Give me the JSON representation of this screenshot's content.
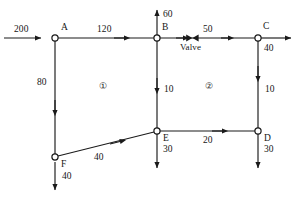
{
  "diagram": {
    "type": "flow-network",
    "stroke_color": "#1a1a1a",
    "text_color": "#161616",
    "background": "#ffffff",
    "nodes": [
      {
        "id": "A",
        "label": "A",
        "x": 55,
        "y": 38
      },
      {
        "id": "B",
        "label": "B",
        "x": 157,
        "y": 38
      },
      {
        "id": "C",
        "label": "C",
        "x": 258,
        "y": 38
      },
      {
        "id": "D",
        "label": "D",
        "x": 258,
        "y": 131
      },
      {
        "id": "E",
        "label": "E",
        "x": 157,
        "y": 131
      },
      {
        "id": "F",
        "label": "F",
        "x": 55,
        "y": 157
      }
    ],
    "edges": [
      {
        "id": "inflow-A",
        "label": "200",
        "from": "external",
        "to": "A",
        "orientation": "horizontal"
      },
      {
        "id": "A-B",
        "label": "120",
        "from": "A",
        "to": "B",
        "orientation": "horizontal"
      },
      {
        "id": "B-C",
        "label": "50",
        "from": "B",
        "to": "C",
        "orientation": "horizontal",
        "valve": true
      },
      {
        "id": "outflow-B",
        "label": "60",
        "from": "B",
        "to": "external",
        "orientation": "vertical-up"
      },
      {
        "id": "outflow-C",
        "label": "40",
        "from": "C",
        "to": "external",
        "orientation": "horizontal"
      },
      {
        "id": "A-F",
        "label": "80",
        "from": "A",
        "to": "F",
        "orientation": "vertical-down"
      },
      {
        "id": "B-E",
        "label": "10",
        "from": "B",
        "to": "E",
        "orientation": "vertical-down"
      },
      {
        "id": "C-D",
        "label": "10",
        "from": "C",
        "to": "D",
        "orientation": "vertical-down"
      },
      {
        "id": "F-E",
        "label": "40",
        "from": "F",
        "to": "E",
        "orientation": "diagonal"
      },
      {
        "id": "E-D",
        "label": "20",
        "from": "E",
        "to": "D",
        "orientation": "horizontal"
      },
      {
        "id": "outflow-F",
        "label": "40",
        "from": "F",
        "to": "external",
        "orientation": "vertical-down"
      },
      {
        "id": "outflow-E",
        "label": "30",
        "from": "E",
        "to": "external",
        "orientation": "vertical-down"
      },
      {
        "id": "outflow-D",
        "label": "30",
        "from": "D",
        "to": "external",
        "orientation": "vertical-down"
      }
    ],
    "annotations": {
      "valve_label": "Valve",
      "region_1": "①",
      "region_2": "②"
    }
  }
}
